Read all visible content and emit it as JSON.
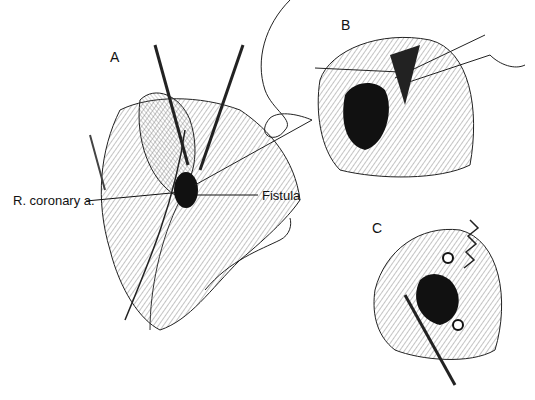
{
  "figure": {
    "panels": [
      {
        "id": "A",
        "label": "A"
      },
      {
        "id": "B",
        "label": "B"
      },
      {
        "id": "C",
        "label": "C"
      }
    ],
    "callouts": {
      "coronary": "R. coronary a.",
      "fistula": "Fistula"
    },
    "colors": {
      "ink": "#111111",
      "background": "#ffffff",
      "shade": "#888888"
    }
  }
}
